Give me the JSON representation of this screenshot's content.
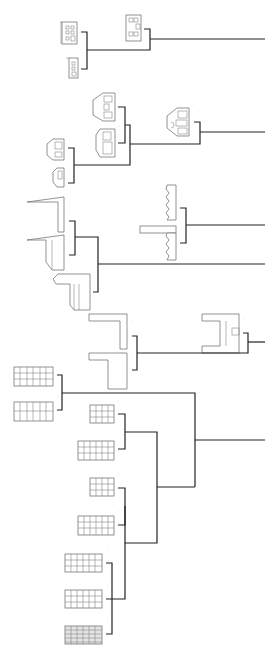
{
  "diagram": {
    "type": "dendrogram",
    "orientation": "rotated-90",
    "colors": {
      "line": "#222222",
      "building": "#777777",
      "background": "#ffffff"
    },
    "groups": [
      {
        "id": "g1",
        "name": "small-townhouses",
        "leaves": [
          "townhouse-a",
          "townhouse-b",
          "townhouse-c"
        ]
      },
      {
        "id": "g2",
        "name": "gabled-houses",
        "leaves": [
          "gabled-a",
          "gabled-b",
          "gabled-c",
          "gabled-d",
          "gabled-e"
        ]
      },
      {
        "id": "g3",
        "name": "sawtooth-sheds",
        "leaves": [
          "sawtooth-a",
          "sawtooth-b"
        ]
      },
      {
        "id": "g4",
        "name": "towers-slabs",
        "leaves": [
          "tower-a",
          "tower-b",
          "slab-podium"
        ]
      },
      {
        "id": "g5",
        "name": "L-blocks",
        "leaves": [
          "l-block-a",
          "l-block-b"
        ]
      },
      {
        "id": "g6",
        "name": "H-block",
        "leaves": [
          "h-block"
        ]
      },
      {
        "id": "g7",
        "name": "grid-facades",
        "leaves": [
          "grid-a",
          "grid-b"
        ]
      },
      {
        "id": "g8",
        "name": "apartment-blocks",
        "leaves": [
          "apt-a",
          "apt-b",
          "apt-c",
          "apt-d",
          "apt-e",
          "apt-f",
          "apt-g"
        ]
      }
    ],
    "labels": {
      "l1": "·",
      "l2": "·",
      "l3": "·",
      "l4": "·",
      "l5": "·",
      "l6": "·",
      "l7": "·",
      "l8": "·",
      "l9": "·",
      "l10": "·",
      "l11": "·",
      "l12": "·",
      "l13": "·",
      "l14": "·",
      "l15": "·",
      "l16": "·",
      "l17": "·",
      "l18": "·",
      "l19": "·",
      "l20": "·",
      "l21": "·",
      "l22": "·",
      "l23": "·",
      "l24": "·",
      "l25": "·",
      "l26": "·",
      "l27": "·"
    }
  }
}
